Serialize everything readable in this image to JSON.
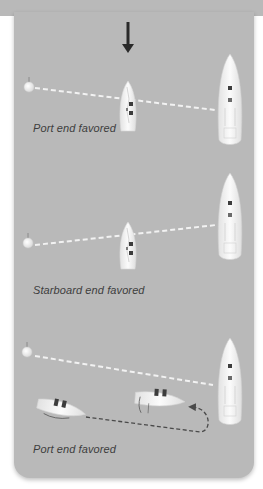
{
  "wind_arrow": {
    "icon": "wind-direction-arrow-icon",
    "direction": "down"
  },
  "panels": [
    {
      "caption": "Port end favored",
      "line": "port buoy to committee boat, tilted down to starboard"
    },
    {
      "caption": "Starboard end favored",
      "line": "port buoy to committee boat, tilted up to starboard"
    },
    {
      "caption": "Port end favored",
      "line": "port buoy to committee boat, boats circling behind the line"
    }
  ],
  "colors": {
    "background": "#b9b9b9",
    "page": "#ffffff",
    "caption": "#3d3d3d",
    "start_line": "#f2f2f2",
    "path": "#4a4a4a",
    "hull": "#f4f4f4"
  }
}
